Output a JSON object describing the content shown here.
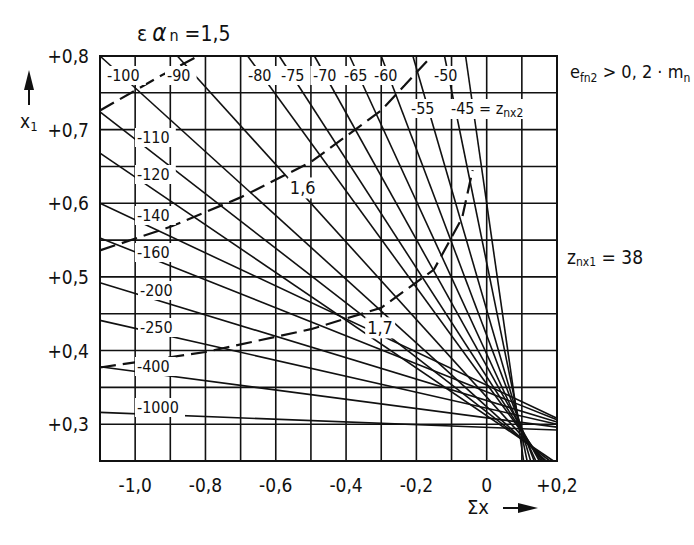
{
  "chart_data": {
    "type": "line",
    "xlabel": "Σx",
    "ylabel": "x1",
    "xlim": [
      -1.1,
      0.2
    ],
    "ylim": [
      0.25,
      0.8
    ],
    "grid": true,
    "x_ticks": [
      {
        "value": -1.0,
        "label": "-1,0"
      },
      {
        "value": -0.8,
        "label": "-0,8"
      },
      {
        "value": -0.6,
        "label": "-0,6"
      },
      {
        "value": -0.4,
        "label": "-0,4"
      },
      {
        "value": -0.2,
        "label": "-0,2"
      },
      {
        "value": 0.0,
        "label": "0"
      },
      {
        "value": 0.2,
        "label": "+0,2"
      }
    ],
    "y_ticks": [
      {
        "value": 0.8,
        "label": "+0,8"
      },
      {
        "value": 0.7,
        "label": "+0,7"
      },
      {
        "value": 0.6,
        "label": "+0,6"
      },
      {
        "value": 0.5,
        "label": "+0,5"
      },
      {
        "value": 0.4,
        "label": "+0,4"
      },
      {
        "value": 0.3,
        "label": "+0,3"
      }
    ],
    "annotations": [
      {
        "text": "e_fn2 > 0,2 · m_n",
        "position": "top-right"
      },
      {
        "text": "z_nx1 = 38",
        "position": "right-middle"
      },
      {
        "text": "-45 = z_nx2",
        "position": "top"
      }
    ],
    "series_label": "z_nx2",
    "series": [
      {
        "name": "-1000",
        "points": [
          [
            -1.1,
            0.316
          ],
          [
            0.2,
            0.292
          ]
        ]
      },
      {
        "name": "-400",
        "points": [
          [
            -1.1,
            0.378
          ],
          [
            0.2,
            0.296
          ]
        ]
      },
      {
        "name": "-250",
        "points": [
          [
            -1.1,
            0.441
          ],
          [
            0.2,
            0.3
          ]
        ]
      },
      {
        "name": "-200",
        "points": [
          [
            -1.1,
            0.492
          ],
          [
            0.2,
            0.303
          ]
        ]
      },
      {
        "name": "-160",
        "points": [
          [
            -1.1,
            0.553
          ],
          [
            0.2,
            0.306
          ]
        ]
      },
      {
        "name": "-140",
        "points": [
          [
            -1.1,
            0.6
          ],
          [
            0.2,
            0.308
          ]
        ]
      },
      {
        "name": "-120",
        "points": [
          [
            -1.1,
            0.668
          ],
          [
            0.19,
            0.25
          ]
        ]
      },
      {
        "name": "-110",
        "points": [
          [
            -1.1,
            0.724
          ],
          [
            0.18,
            0.25
          ]
        ]
      },
      {
        "name": "-100",
        "points": [
          [
            -1.1,
            0.8
          ],
          [
            0.17,
            0.25
          ]
        ]
      },
      {
        "name": "-90",
        "points": [
          [
            -0.88,
            0.8
          ],
          [
            0.165,
            0.25
          ]
        ]
      },
      {
        "name": "-80",
        "points": [
          [
            -0.68,
            0.8
          ],
          [
            0.16,
            0.25
          ]
        ]
      },
      {
        "name": "-75",
        "points": [
          [
            -0.59,
            0.8
          ],
          [
            0.155,
            0.25
          ]
        ]
      },
      {
        "name": "-70",
        "points": [
          [
            -0.49,
            0.8
          ],
          [
            0.15,
            0.25
          ]
        ]
      },
      {
        "name": "-65",
        "points": [
          [
            -0.39,
            0.8
          ],
          [
            0.14,
            0.25
          ]
        ]
      },
      {
        "name": "-60",
        "points": [
          [
            -0.3,
            0.8
          ],
          [
            0.135,
            0.25
          ]
        ]
      },
      {
        "name": "-55",
        "points": [
          [
            -0.21,
            0.8
          ],
          [
            0.125,
            0.25
          ]
        ]
      },
      {
        "name": "-50",
        "points": [
          [
            -0.12,
            0.8
          ],
          [
            0.115,
            0.25
          ]
        ]
      },
      {
        "name": "-45",
        "points": [
          [
            -0.06,
            0.8
          ],
          [
            0.105,
            0.25
          ]
        ]
      }
    ],
    "dashed_series": [
      {
        "name": "εαn = 1,5",
        "points": [
          [
            -1.1,
            0.726
          ],
          [
            -0.92,
            0.775
          ],
          [
            -0.82,
            0.8
          ]
        ]
      },
      {
        "name": "1,6",
        "points": [
          [
            -1.1,
            0.536
          ],
          [
            -0.9,
            0.568
          ],
          [
            -0.7,
            0.608
          ],
          [
            -0.5,
            0.656
          ],
          [
            -0.3,
            0.726
          ],
          [
            -0.17,
            0.793
          ]
        ]
      },
      {
        "name": "1,7",
        "points": [
          [
            -1.1,
            0.377
          ],
          [
            -0.8,
            0.398
          ],
          [
            -0.5,
            0.429
          ],
          [
            -0.3,
            0.458
          ],
          [
            -0.15,
            0.51
          ],
          [
            -0.07,
            0.58
          ],
          [
            -0.04,
            0.645
          ]
        ]
      }
    ],
    "curve_labels": {
      "dashed_1_6": {
        "text": "1,6",
        "x": -0.56,
        "y": 0.612
      },
      "dashed_1_7": {
        "text": "1,7",
        "x": -0.34,
        "y": 0.422
      }
    }
  },
  "labels": {
    "title_eps": "ε",
    "title_alpha": "α",
    "title_sub": "n",
    "title_eq": " =1,5",
    "y_axis": "x",
    "y_axis_sub": "1",
    "x_axis": "Σx",
    "cond_main": "e",
    "cond_sub": "fn2",
    "cond_rest": " > 0, 2 · m",
    "cond_sub2": "n",
    "znx1_main": "z",
    "znx1_sub": "nx1",
    "znx1_rest": " = 38",
    "znx2_prefix": "-45 = z",
    "znx2_sub": "nx2",
    "dashed_1_6": "1,6",
    "dashed_1_7": "1,7"
  }
}
